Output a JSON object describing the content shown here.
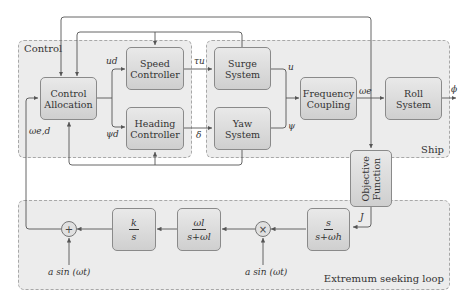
{
  "groups": {
    "control": {
      "label": "Control"
    },
    "ship": {
      "label": "Ship"
    },
    "esc": {
      "label": "Extremum seeking loop"
    }
  },
  "blocks": {
    "control_allocation": {
      "line1": "Control",
      "line2": "Allocation"
    },
    "speed_controller": {
      "line1": "Speed",
      "line2": "Controller"
    },
    "heading_controller": {
      "line1": "Heading",
      "line2": "Controller"
    },
    "surge_system": {
      "line1": "Surge",
      "line2": "System"
    },
    "yaw_system": {
      "line1": "Yaw",
      "line2": "System"
    },
    "frequency_coupling": {
      "line1": "Frequency",
      "line2": "Coupling"
    },
    "roll_system": {
      "line1": "Roll",
      "line2": "System"
    },
    "objective_function": {
      "line1": "Objective",
      "line2": "Function"
    },
    "highpass": {
      "num": "s",
      "den": "s+ωh"
    },
    "lowpass": {
      "num": "ωl",
      "den": "s+ωl"
    },
    "integrator": {
      "num": "k",
      "den": "s"
    }
  },
  "junctions": {
    "sum": {
      "symbol": "+"
    },
    "multiply": {
      "symbol": "×"
    }
  },
  "signals": {
    "u_d": "ud",
    "psi_d": "ψd",
    "omega_ed": "ωe,d",
    "tau_u": "τu",
    "delta": "δ",
    "u": "u",
    "psi": "ψ",
    "omega_e": "ωe",
    "phi": "ϕ",
    "J": "J",
    "dither": "a sin (ωt)",
    "demod": "a sin (ωt)"
  },
  "colors": {
    "group_fill": "#ececec",
    "group_border": "#a8a8a8",
    "block_top": "#e9e9e9",
    "block_bottom": "#cfcfcf",
    "wire": "#555555"
  }
}
